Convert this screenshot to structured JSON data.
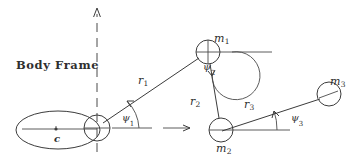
{
  "figure": {
    "title": "Body Frame",
    "background_color": "#ffffff",
    "ink_color": "#3b3b3b",
    "labels": {
      "body_frame": "Body Frame",
      "center_of_mass": "c",
      "mass_1": "m",
      "mass_1_sub": "1",
      "mass_2": "m",
      "mass_2_sub": "2",
      "mass_3": "m",
      "mass_3_sub": "3",
      "link_1": "r",
      "link_1_sub": "1",
      "link_2": "r",
      "link_2_sub": "2",
      "link_3": "r",
      "link_3_sub": "3",
      "angle_1": "ψ",
      "angle_1_sub": "1",
      "angle_2": "ψ",
      "angle_2_sub": "2",
      "angle_3": "ψ",
      "angle_3_sub": "3"
    },
    "nodes": [
      {
        "name": "body-origin",
        "x": 97,
        "y": 128,
        "radius": 13
      },
      {
        "name": "mass-1",
        "x": 208,
        "y": 52,
        "radius": 12
      },
      {
        "name": "mass-2",
        "x": 221,
        "y": 130,
        "radius": 12
      },
      {
        "name": "mass-3",
        "x": 329,
        "y": 94,
        "radius": 12
      }
    ],
    "links": [
      {
        "name": "r1",
        "from": "body-origin",
        "to": "mass-1"
      },
      {
        "name": "r2",
        "from": "mass-1",
        "to": "mass-2"
      },
      {
        "name": "r3",
        "from": "mass-2",
        "to": "mass-3"
      }
    ],
    "axes": {
      "vertical_dashed": {
        "x": 97,
        "y_top": 8,
        "y_bottom": 152
      },
      "horizontal_arrow": {
        "x_start": 110,
        "x_end": 190,
        "y": 128
      },
      "reference_m1": {
        "x_start": 208,
        "x_end": 272,
        "y": 52
      },
      "reference_m2": {
        "x_start": 221,
        "x_end": 290,
        "y": 130
      }
    },
    "hull": {
      "name": "body-ellipse",
      "cx": 58,
      "cy": 130,
      "rx": 42,
      "ry": 19
    }
  }
}
